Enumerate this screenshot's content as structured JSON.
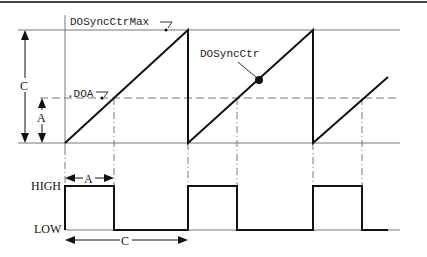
{
  "diagram": {
    "labels": {
      "max": "DOSyncCtrMax",
      "doa": ".DOA",
      "counter": "DOSyncCtr",
      "c_vertical": "C",
      "a_vertical": "A",
      "high": "HIGH",
      "low": "LOW",
      "a_horizontal": "A",
      "c_horizontal": "C"
    },
    "colors": {
      "line": "#111111",
      "grid": "#777777",
      "border": "#444444"
    },
    "sawtooth": {
      "max_level": "DOSyncCtrMax",
      "threshold_level": "DOA",
      "periods_shown": 2.6
    },
    "square_wave": {
      "levels": [
        "HIGH",
        "LOW"
      ],
      "high_duration": "A",
      "period": "C"
    }
  }
}
